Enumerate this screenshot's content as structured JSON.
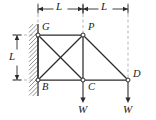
{
  "figure": {
    "type": "engineering-statics-truss-diagram",
    "colors": {
      "member": "#2b2b2b",
      "dimension": "#2b2b2b",
      "dashed": "#9a9a9a",
      "wall_hatch": "#6e6e6e",
      "node_fill": "#ffffff",
      "background": "#ffffff",
      "label": "#1a1a1a"
    }
  },
  "nodes": [
    {
      "id": "G",
      "label": "G",
      "x": 38,
      "y": 35,
      "label_dx": 4,
      "label_dy": -13,
      "support": "pinned-to-wall"
    },
    {
      "id": "P",
      "label": "P",
      "x": 83,
      "y": 35,
      "label_dx": 5,
      "label_dy": -13,
      "support": "free"
    },
    {
      "id": "B",
      "label": "B",
      "x": 38,
      "y": 80,
      "label_dx": 4,
      "label_dy": 2,
      "support": "pinned-to-wall"
    },
    {
      "id": "C",
      "label": "C",
      "x": 83,
      "y": 80,
      "label_dx": 5,
      "label_dy": 2,
      "support": "free"
    },
    {
      "id": "D",
      "label": "D",
      "x": 128,
      "y": 80,
      "label_dx": 5,
      "label_dy": -11,
      "support": "free"
    }
  ],
  "members": [
    {
      "from": "G",
      "to": "P",
      "name": "member-GP"
    },
    {
      "from": "G",
      "to": "B",
      "name": "member-GB"
    },
    {
      "from": "P",
      "to": "C",
      "name": "member-PC"
    },
    {
      "from": "B",
      "to": "C",
      "name": "member-BC"
    },
    {
      "from": "C",
      "to": "D",
      "name": "member-CD"
    },
    {
      "from": "G",
      "to": "C",
      "name": "member-GC-diagonal"
    },
    {
      "from": "B",
      "to": "P",
      "name": "member-BP-diagonal"
    },
    {
      "from": "P",
      "to": "D",
      "name": "member-PD-diagonal"
    }
  ],
  "wall": {
    "name": "fixed-wall-support",
    "x": 38,
    "top": 24,
    "bottom": 96,
    "hatch_width": 9
  },
  "loads": [
    {
      "at": "C",
      "label": "W",
      "x": 83,
      "y_start": 82,
      "y_end": 103,
      "label_x": 78,
      "label_y": 104,
      "direction": "down"
    },
    {
      "at": "D",
      "label": "W",
      "x": 128,
      "y_start": 82,
      "y_end": 103,
      "label_x": 123,
      "label_y": 104,
      "direction": "down"
    }
  ],
  "dimensions": {
    "horizontal": [
      {
        "label": "L",
        "x1": 38,
        "x2": 83,
        "y": 9,
        "label_x": 56,
        "label_y": 1
      },
      {
        "label": "L",
        "x1": 83,
        "x2": 128,
        "y": 9,
        "label_x": 101,
        "label_y": 1
      }
    ],
    "vertical": [
      {
        "label": "L",
        "y1": 35,
        "y2": 80,
        "x": 17,
        "label_x": 9,
        "label_y": 51
      }
    ],
    "extension_lines": [
      {
        "name": "ext-line-G-vertical",
        "x1": 38,
        "y1": 3,
        "x2": 38,
        "y2": 33
      },
      {
        "name": "ext-line-P-vertical",
        "x1": 83,
        "y1": 3,
        "x2": 83,
        "y2": 33
      },
      {
        "name": "ext-line-D-vertical",
        "x1": 128,
        "y1": 3,
        "x2": 128,
        "y2": 78
      },
      {
        "name": "ext-line-G-horizontal",
        "x1": 13,
        "y1": 35,
        "x2": 36,
        "y2": 35
      },
      {
        "name": "ext-line-B-horizontal",
        "x1": 13,
        "y1": 80,
        "x2": 36,
        "y2": 80
      }
    ]
  }
}
